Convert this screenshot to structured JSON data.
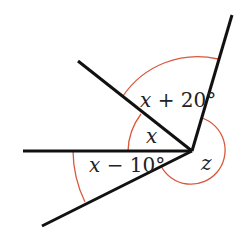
{
  "diagram": {
    "type": "angles-at-a-point",
    "vertex": {
      "x": 192,
      "y": 151
    },
    "colors": {
      "ray": "#111111",
      "arc": "#d9573a",
      "text": "#222222",
      "background": "#ffffff"
    },
    "rays": [
      {
        "name": "ray-up-right",
        "end": {
          "x": 232,
          "y": 15
        }
      },
      {
        "name": "ray-upper-left",
        "end": {
          "x": 78,
          "y": 61
        }
      },
      {
        "name": "ray-left-horizontal",
        "end": {
          "x": 23,
          "y": 151
        }
      },
      {
        "name": "ray-lower-left",
        "end": {
          "x": 42,
          "y": 226
        }
      }
    ],
    "angles": [
      {
        "name": "angle-x-plus-20",
        "between": [
          "ray-upper-left",
          "ray-up-right"
        ],
        "var": "x",
        "rest": " + 20°",
        "label": "x + 20°"
      },
      {
        "name": "angle-x",
        "between": [
          "ray-left-horizontal",
          "ray-upper-left"
        ],
        "var": "x",
        "rest": "",
        "label": "x"
      },
      {
        "name": "angle-x-minus-10",
        "between": [
          "ray-left-horizontal",
          "ray-lower-left"
        ],
        "var": "x",
        "rest": " − 10°",
        "label": "x − 10°"
      },
      {
        "name": "angle-z",
        "between": [
          "ray-up-right",
          "ray-lower-left"
        ],
        "var": "z",
        "rest": "",
        "label": "z",
        "reflex": true
      }
    ]
  }
}
